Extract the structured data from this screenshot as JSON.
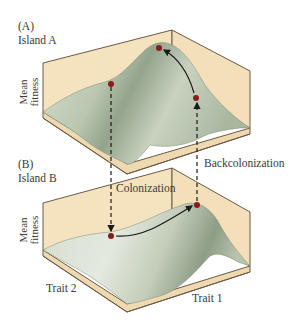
{
  "panels": [
    {
      "id": "A",
      "letter": "(A)",
      "title": "Island A",
      "y_axis_label_line1": "Mean",
      "y_axis_label_line2": "fitness"
    },
    {
      "id": "B",
      "letter": "(B)",
      "title": "Island B",
      "y_axis_label_line1": "Mean",
      "y_axis_label_line2": "fitness",
      "x_axis_left": "Trait 2",
      "x_axis_right": "Trait 1"
    }
  ],
  "annotations": {
    "colonization": "Colonization",
    "backcolonization": "Backcolonization"
  },
  "colors": {
    "box_wall": "#f5e3c0",
    "box_edge": "#6b5a45",
    "surface": "#c9d3c0",
    "surface_shadow": "#8f9e88",
    "dot": "#8b1a1a",
    "arrow": "#1a1a1a"
  }
}
